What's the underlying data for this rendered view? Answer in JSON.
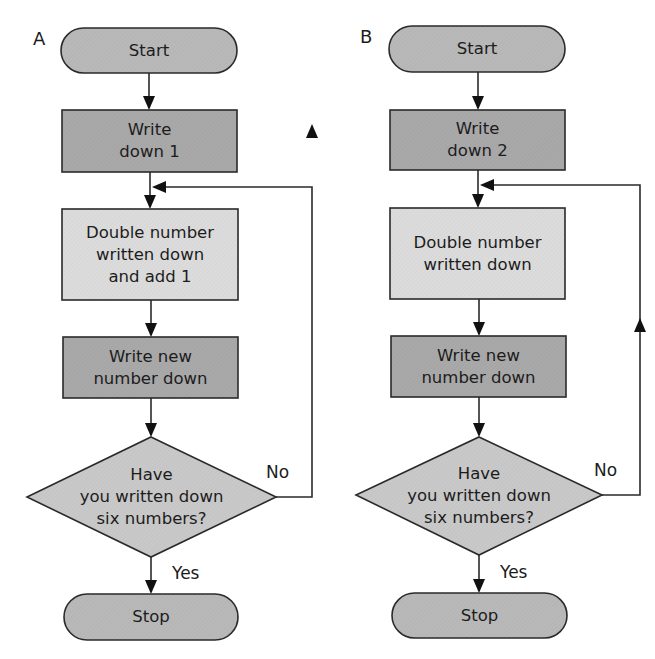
{
  "colors": {
    "terminal_fill": "#b9b9b9",
    "process_dark_fill": "#a9a9a9",
    "process_light_fill": "#dcdcdc",
    "decision_fill": "#c9c9c9",
    "stroke": "#2a2a2a",
    "background": "#ffffff"
  },
  "flowcharts": [
    {
      "label": "A",
      "start": "Start",
      "step1": [
        "Write",
        "down 1"
      ],
      "step2": [
        "Double number",
        "written down",
        "and add 1"
      ],
      "step3": [
        "Write new",
        "number down"
      ],
      "decision": [
        "Have",
        "you written down",
        "six numbers?"
      ],
      "no_label": "No",
      "yes_label": "Yes",
      "stop": "Stop"
    },
    {
      "label": "B",
      "start": "Start",
      "step1": [
        "Write",
        "down 2"
      ],
      "step2": [
        "Double number",
        "written down"
      ],
      "step3": [
        "Write new",
        "number down"
      ],
      "decision": [
        "Have",
        "you written down",
        "six numbers?"
      ],
      "no_label": "No",
      "yes_label": "Yes",
      "stop": "Stop"
    }
  ]
}
